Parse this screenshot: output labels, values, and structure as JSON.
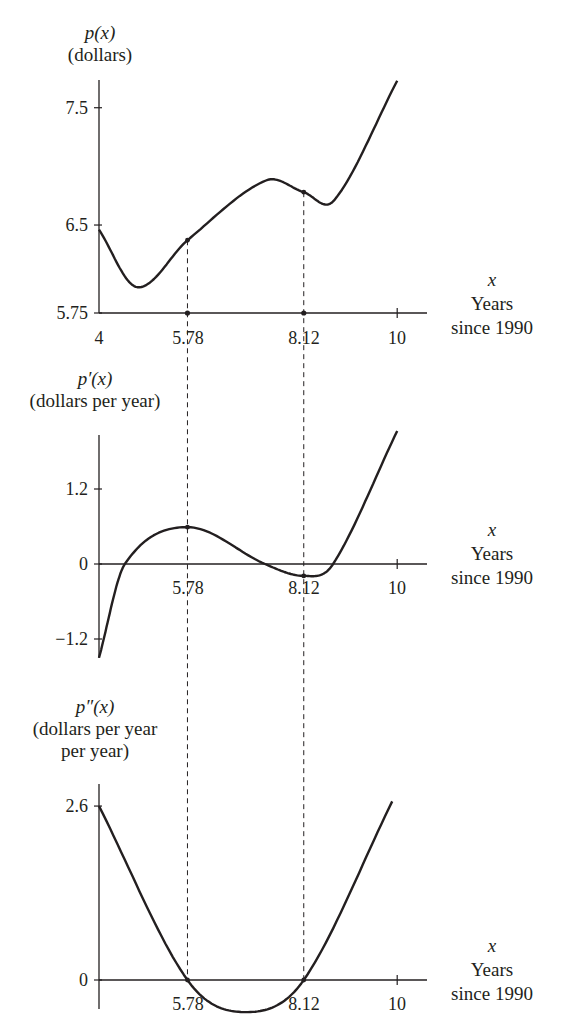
{
  "chart_data": [
    {
      "type": "line",
      "id": "p",
      "title": "p(x)",
      "ylabel_func": "p(x)",
      "ylabel_units": [
        "(dollars)"
      ],
      "xlabel_var": "x",
      "xlabel": [
        "Years",
        "since 1990"
      ],
      "xlim": [
        4,
        10
      ],
      "ylim": [
        5.75,
        7.75
      ],
      "xticks": [
        {
          "value": 4,
          "label": "4"
        },
        {
          "value": 5.78,
          "label": "5.78"
        },
        {
          "value": 8.12,
          "label": "8.12"
        },
        {
          "value": 10,
          "label": "10"
        }
      ],
      "yticks": [
        {
          "value": 5.75,
          "label": "5.75"
        },
        {
          "value": 6.5,
          "label": "6.5"
        },
        {
          "value": 7.5,
          "label": "7.5"
        }
      ],
      "marked_points": [
        {
          "x": 5.78,
          "y": 6.37,
          "note": "inflection point"
        },
        {
          "x": 8.12,
          "y": 6.78,
          "note": "inflection point"
        }
      ],
      "x": [
        4.0,
        4.77,
        5.78,
        7.36,
        8.12,
        8.73,
        10.0
      ],
      "values": [
        6.46,
        5.97,
        6.37,
        6.88,
        6.78,
        6.71,
        7.73
      ],
      "grid": false
    },
    {
      "type": "line",
      "id": "dp",
      "title": "p'(x)",
      "ylabel_func": "p′(x)",
      "ylabel_units": [
        "(dollars per year)"
      ],
      "xlabel_var": "x",
      "xlabel": [
        "Years",
        "since 1990"
      ],
      "xlim": [
        4,
        10
      ],
      "ylim": [
        -1.5,
        2.1
      ],
      "xticks": [
        {
          "value": 5.78,
          "label": "5.78"
        },
        {
          "value": 8.12,
          "label": "8.12"
        },
        {
          "value": 10,
          "label": "10"
        }
      ],
      "yticks": [
        {
          "value": -1.2,
          "label": "−1.2"
        },
        {
          "value": 0,
          "label": "0"
        },
        {
          "value": 1.2,
          "label": "1.2"
        }
      ],
      "marked_points": [
        {
          "x": 5.78,
          "y": 0.59,
          "note": "local maximum"
        },
        {
          "x": 8.12,
          "y": -0.19,
          "note": "local minimum"
        }
      ],
      "x": [
        4.0,
        4.52,
        5.78,
        7.34,
        8.12,
        8.71,
        10.0
      ],
      "values": [
        -1.5,
        0.0,
        0.59,
        0.0,
        -0.19,
        0.0,
        2.13
      ],
      "grid": false
    },
    {
      "type": "line",
      "id": "ddp",
      "title": "p''(x)",
      "ylabel_func": "p″(x)",
      "ylabel_units": [
        "(dollars per year",
        "per year)"
      ],
      "xlabel_var": "x",
      "xlabel": [
        "Years",
        "since 1990"
      ],
      "xlim": [
        4,
        10
      ],
      "ylim": [
        -0.48,
        2.67
      ],
      "xticks": [
        {
          "value": 5.78,
          "label": "5.78"
        },
        {
          "value": 8.12,
          "label": "8.12"
        },
        {
          "value": 10,
          "label": "10"
        }
      ],
      "yticks": [
        {
          "value": 0,
          "label": "0"
        },
        {
          "value": 2.6,
          "label": "2.6"
        }
      ],
      "marked_points": [
        {
          "x": 5.78,
          "y": 0,
          "note": "zero"
        },
        {
          "x": 8.12,
          "y": 0,
          "note": "zero"
        }
      ],
      "x": [
        4.0,
        5.78,
        6.95,
        8.12,
        9.9
      ],
      "values": [
        2.6,
        0.0,
        -0.48,
        0.0,
        2.67
      ],
      "grid": false
    }
  ],
  "style": {
    "line_color": "#231f20",
    "background": "#ffffff"
  }
}
